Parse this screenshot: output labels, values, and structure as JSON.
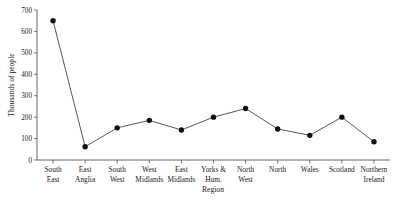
{
  "chart_data": {
    "type": "line",
    "title": "",
    "xlabel": "Region",
    "ylabel": "Thousands of people",
    "categories": [
      "South East",
      "East Anglia",
      "South West",
      "West Midlands",
      "East Midlands",
      "Yorks & Hum.",
      "North West",
      "North",
      "Wales",
      "Scotland",
      "Northern Ireland"
    ],
    "category_lines": [
      [
        "South",
        "East"
      ],
      [
        "East",
        "Anglia"
      ],
      [
        "South",
        "West"
      ],
      [
        "West",
        "Midlands"
      ],
      [
        "East",
        "Midlands"
      ],
      [
        "Yorks &",
        "Hum."
      ],
      [
        "North",
        "West"
      ],
      [
        "North",
        ""
      ],
      [
        "Wales",
        ""
      ],
      [
        "Scotland",
        ""
      ],
      [
        "Northern",
        "Ireland"
      ]
    ],
    "values": [
      650,
      62,
      150,
      185,
      140,
      200,
      240,
      145,
      115,
      200,
      85
    ],
    "ylim": [
      0,
      700
    ],
    "yticks": [
      0,
      100,
      200,
      300,
      400,
      500,
      600,
      700
    ],
    "ytick_labels": [
      "0",
      "100",
      "200",
      "300",
      "400",
      "500",
      "600",
      "700"
    ],
    "grid": false,
    "legend": null,
    "marker": "filled-circle",
    "line_color": "#3a3a3a",
    "marker_color": "#111111",
    "axis_color": "#555555"
  }
}
